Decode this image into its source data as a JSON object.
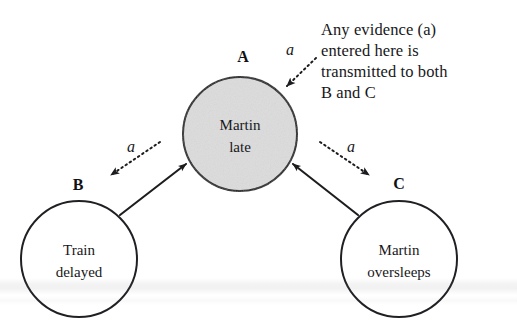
{
  "diagram": {
    "background_color": "#ffffff",
    "ink_color": "#1a1a1a",
    "shaded_fill": "#dcdcdc",
    "nodes": [
      {
        "key": "A",
        "label_line1": "Martin",
        "label_line2": "late",
        "shaded": true,
        "cx": 240,
        "cy": 134,
        "r": 57
      },
      {
        "key": "B",
        "label_line1": "Train",
        "label_line2": "delayed",
        "shaded": false,
        "cx": 79,
        "cy": 259,
        "r": 58
      },
      {
        "key": "C",
        "label_line1": "Martin",
        "label_line2": "oversleeps",
        "shaded": false,
        "cx": 399,
        "cy": 259,
        "r": 58
      }
    ],
    "links": [
      {
        "from": "B",
        "to": "A",
        "style": "solid"
      },
      {
        "from": "C",
        "to": "A",
        "style": "solid"
      }
    ],
    "evidence_flows": [
      {
        "name": "evidence-into-a",
        "label": "a",
        "style": "dotted",
        "direction": "into-A"
      },
      {
        "name": "evidence-a-to-b",
        "label": "a",
        "style": "dotted",
        "direction": "A-to-B"
      },
      {
        "name": "evidence-a-to-c",
        "label": "a",
        "style": "dotted",
        "direction": "A-to-C"
      }
    ],
    "annotation": {
      "lines": [
        "Any evidence (a)",
        "entered here is",
        "transmitted to both",
        "B and C"
      ],
      "text": "Any evidence (a)\nentered here is\ntransmitted to both\nB and C"
    }
  }
}
